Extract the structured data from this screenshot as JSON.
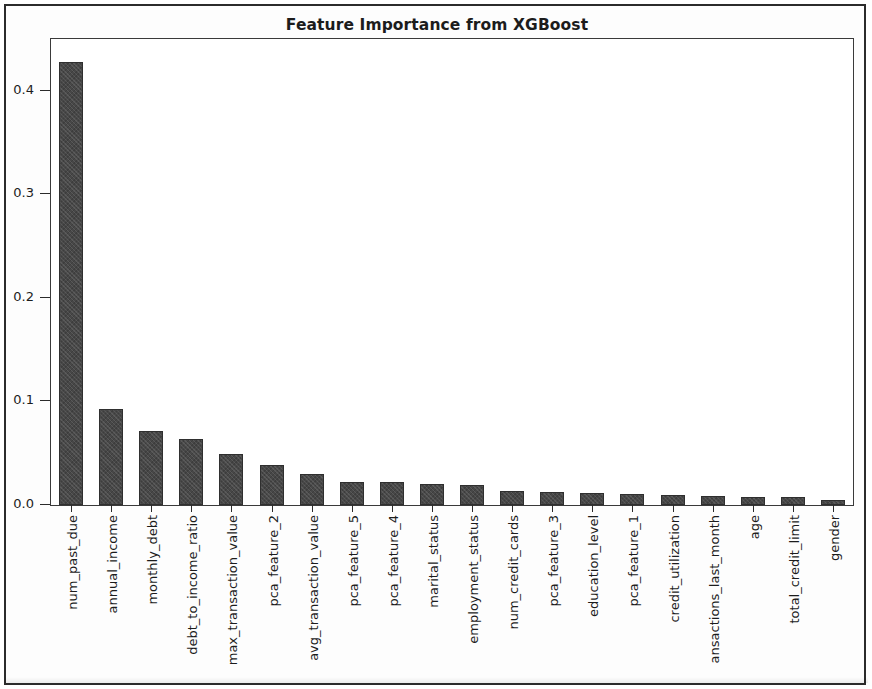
{
  "chart_data": {
    "type": "bar",
    "title": "Feature Importance from XGBoost",
    "xlabel": "",
    "ylabel": "",
    "ylim": [
      0.0,
      0.45
    ],
    "yticks": [
      "0.0",
      "0.1",
      "0.2",
      "0.3",
      "0.4"
    ],
    "ytick_values": [
      0.0,
      0.1,
      0.2,
      0.3,
      0.4
    ],
    "grid": false,
    "legend": null,
    "orientation": "vertical",
    "bar_color": "#474747",
    "categories": [
      "num_past_due",
      "annual_income",
      "monthly_debt",
      "debt_to_income_ratio",
      "max_transaction_value",
      "pca_feature_2",
      "avg_transaction_value",
      "pca_feature_5",
      "pca_feature_4",
      "marital_status",
      "employment_status",
      "num_credit_cards",
      "pca_feature_3",
      "education_level",
      "pca_feature_1",
      "credit_utilization",
      "ansactions_last_month",
      "age",
      "total_credit_limit",
      "gender"
    ],
    "values": [
      0.428,
      0.093,
      0.071,
      0.064,
      0.049,
      0.039,
      0.03,
      0.022,
      0.022,
      0.02,
      0.019,
      0.014,
      0.013,
      0.012,
      0.011,
      0.01,
      0.009,
      0.008,
      0.008,
      0.005
    ]
  }
}
